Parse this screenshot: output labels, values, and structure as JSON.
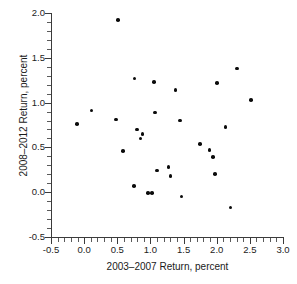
{
  "chart_data": {
    "type": "scatter",
    "title": "",
    "xlabel": "2003–2007 Return, percent",
    "ylabel": "2008–2012 Return, percent",
    "xlim": [
      -0.5,
      3.0
    ],
    "ylim": [
      -0.5,
      2.0
    ],
    "xticks": [
      -0.5,
      0.0,
      0.5,
      1.0,
      1.5,
      2.0,
      2.5,
      3.0
    ],
    "yticks": [
      -0.5,
      0.0,
      0.5,
      1.0,
      1.5,
      2.0
    ],
    "xtick_labels": [
      "-0.5",
      "0.0",
      "0.5",
      "1.0",
      "1.5",
      "2.0",
      "2.5",
      "3.0"
    ],
    "ytick_labels": [
      "-0.5",
      "0.0",
      "0.5",
      "1.0",
      "1.5",
      "2.0"
    ],
    "minor_tick_interval": 0.1,
    "grid": false,
    "legend": null,
    "marker": "filled-circle",
    "marker_color": "#0b0b0b",
    "points": [
      {
        "x": -0.11,
        "y": 0.76
      },
      {
        "x": 0.11,
        "y": 0.91
      },
      {
        "x": 0.51,
        "y": 1.92
      },
      {
        "x": 0.48,
        "y": 0.81
      },
      {
        "x": 0.59,
        "y": 0.46
      },
      {
        "x": 0.75,
        "y": 0.07
      },
      {
        "x": 0.76,
        "y": 1.27
      },
      {
        "x": 0.8,
        "y": 0.7
      },
      {
        "x": 0.85,
        "y": 0.6
      },
      {
        "x": 0.88,
        "y": 0.65
      },
      {
        "x": 0.96,
        "y": -0.01
      },
      {
        "x": 1.02,
        "y": -0.01
      },
      {
        "x": 1.05,
        "y": 1.23
      },
      {
        "x": 1.07,
        "y": 0.89
      },
      {
        "x": 1.1,
        "y": 0.24
      },
      {
        "x": 1.27,
        "y": 0.28
      },
      {
        "x": 1.3,
        "y": 0.18
      },
      {
        "x": 1.38,
        "y": 1.14
      },
      {
        "x": 1.45,
        "y": 0.8
      },
      {
        "x": 1.47,
        "y": -0.05
      },
      {
        "x": 1.75,
        "y": 0.54
      },
      {
        "x": 1.89,
        "y": 0.47
      },
      {
        "x": 1.94,
        "y": 0.39
      },
      {
        "x": 1.97,
        "y": 0.2
      },
      {
        "x": 2.0,
        "y": 1.22
      },
      {
        "x": 2.13,
        "y": 0.73
      },
      {
        "x": 2.21,
        "y": -0.17
      },
      {
        "x": 2.31,
        "y": 1.38
      },
      {
        "x": 2.52,
        "y": 1.03
      }
    ],
    "n_points": 29
  }
}
